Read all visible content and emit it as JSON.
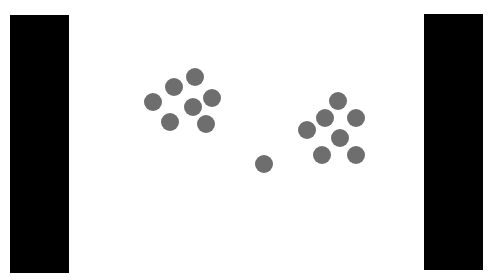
{
  "scene": {
    "width": 493,
    "height": 280,
    "background": "#ffffff",
    "bars": [
      {
        "name": "left-bar",
        "x": 10,
        "y": 15,
        "w": 59,
        "h": 258,
        "color": "#000000"
      },
      {
        "name": "right-bar",
        "x": 424,
        "y": 14,
        "w": 59,
        "h": 256,
        "color": "#000000"
      }
    ],
    "dot_color": "#6e6e6e",
    "dot_radius": 9,
    "clusters": [
      {
        "name": "left-cluster",
        "dots": [
          {
            "cx": 153,
            "cy": 102
          },
          {
            "cx": 174,
            "cy": 87
          },
          {
            "cx": 195,
            "cy": 77
          },
          {
            "cx": 212,
            "cy": 98
          },
          {
            "cx": 193,
            "cy": 107
          },
          {
            "cx": 170,
            "cy": 122
          },
          {
            "cx": 206,
            "cy": 124
          }
        ]
      },
      {
        "name": "right-cluster",
        "dots": [
          {
            "cx": 307,
            "cy": 130
          },
          {
            "cx": 325,
            "cy": 118
          },
          {
            "cx": 338,
            "cy": 101
          },
          {
            "cx": 356,
            "cy": 118
          },
          {
            "cx": 340,
            "cy": 138
          },
          {
            "cx": 322,
            "cy": 155
          },
          {
            "cx": 356,
            "cy": 155
          }
        ]
      },
      {
        "name": "single-dot",
        "dots": [
          {
            "cx": 264,
            "cy": 164
          }
        ]
      }
    ]
  }
}
